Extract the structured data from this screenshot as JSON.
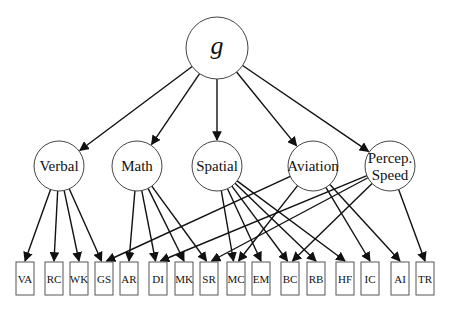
{
  "diagram": {
    "root": {
      "id": "g",
      "label": "g",
      "x": 217,
      "y": 48,
      "r": 31
    },
    "factors": [
      {
        "id": "verbal",
        "label": "Verbal",
        "lines": [
          "Verbal"
        ],
        "x": 59,
        "y": 166,
        "r": 25
      },
      {
        "id": "math",
        "label": "Math",
        "lines": [
          "Math"
        ],
        "x": 137,
        "y": 166,
        "r": 25
      },
      {
        "id": "spatial",
        "label": "Spatial",
        "lines": [
          "Spatial"
        ],
        "x": 217,
        "y": 166,
        "r": 25
      },
      {
        "id": "aviation",
        "label": "Aviation",
        "lines": [
          "Aviation"
        ],
        "x": 313,
        "y": 166,
        "r": 25
      },
      {
        "id": "percep_speed",
        "label": "Percep. Speed",
        "lines": [
          "Percep.",
          "Speed"
        ],
        "x": 390,
        "y": 166,
        "r": 25
      }
    ],
    "tests": [
      {
        "id": "VA",
        "label": "VA",
        "x": 16
      },
      {
        "id": "RC",
        "label": "RC",
        "x": 45
      },
      {
        "id": "WK",
        "label": "WK",
        "x": 70
      },
      {
        "id": "GS",
        "label": "GS",
        "x": 95
      },
      {
        "id": "AR",
        "label": "AR",
        "x": 120
      },
      {
        "id": "DI",
        "label": "DI",
        "x": 149
      },
      {
        "id": "MK",
        "label": "MK",
        "x": 175
      },
      {
        "id": "SR",
        "label": "SR",
        "x": 200
      },
      {
        "id": "MC",
        "label": "MC",
        "x": 227
      },
      {
        "id": "EM",
        "label": "EM",
        "x": 252
      },
      {
        "id": "BC",
        "label": "BC",
        "x": 281
      },
      {
        "id": "RB",
        "label": "RB",
        "x": 307
      },
      {
        "id": "HF",
        "label": "HF",
        "x": 336
      },
      {
        "id": "IC",
        "label": "IC",
        "x": 361
      },
      {
        "id": "AI",
        "label": "AI",
        "x": 391
      },
      {
        "id": "TR",
        "label": "TR",
        "x": 416
      }
    ],
    "test_box": {
      "y": 262,
      "width": 18,
      "height": 33
    },
    "edges": [
      {
        "from": "g",
        "to": "verbal"
      },
      {
        "from": "g",
        "to": "math"
      },
      {
        "from": "g",
        "to": "spatial"
      },
      {
        "from": "g",
        "to": "aviation"
      },
      {
        "from": "g",
        "to": "percep_speed"
      },
      {
        "from": "verbal",
        "to": "VA"
      },
      {
        "from": "verbal",
        "to": "RC"
      },
      {
        "from": "verbal",
        "to": "WK"
      },
      {
        "from": "verbal",
        "to": "GS"
      },
      {
        "from": "math",
        "to": "AR"
      },
      {
        "from": "math",
        "to": "DI"
      },
      {
        "from": "math",
        "to": "MK"
      },
      {
        "from": "math",
        "to": "SR"
      },
      {
        "from": "spatial",
        "to": "MC"
      },
      {
        "from": "spatial",
        "to": "EM"
      },
      {
        "from": "spatial",
        "to": "BC"
      },
      {
        "from": "spatial",
        "to": "RB"
      },
      {
        "from": "spatial",
        "to": "HF"
      },
      {
        "from": "aviation",
        "to": "GS"
      },
      {
        "from": "aviation",
        "to": "MC"
      },
      {
        "from": "aviation",
        "to": "IC"
      },
      {
        "from": "aviation",
        "to": "AI"
      },
      {
        "from": "percep_speed",
        "to": "DI"
      },
      {
        "from": "percep_speed",
        "to": "SR"
      },
      {
        "from": "percep_speed",
        "to": "BC"
      },
      {
        "from": "percep_speed",
        "to": "TR"
      }
    ],
    "colors": {
      "stroke": "#111111",
      "node_outline": "#444444",
      "background": "#ffffff"
    }
  }
}
